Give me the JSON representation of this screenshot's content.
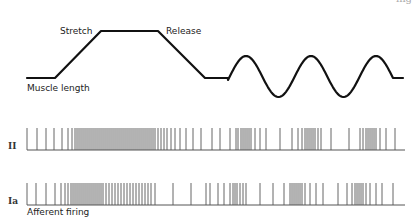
{
  "header": {
    "partial_text": "ing"
  },
  "muscle_trace": {
    "label_stretch": "Stretch",
    "label_release": "Release",
    "label_length": "Muscle length",
    "color": "#111111"
  },
  "rows": [
    {
      "label": "II",
      "name": "type-II"
    },
    {
      "label": "Ia",
      "name": "type-Ia"
    }
  ],
  "footer": {
    "label": "Afferent firing"
  },
  "chart_data": {
    "type": "diagram",
    "muscle_length": {
      "phases": [
        "baseline",
        "stretch (ramp up)",
        "hold",
        "release (ramp down)",
        "baseline",
        "sinusoidal stretch x3",
        "baseline"
      ],
      "points": [
        [
          27,
          78
        ],
        [
          55,
          78
        ],
        [
          101,
          31
        ],
        [
          158,
          31
        ],
        [
          205,
          78
        ],
        [
          228,
          78
        ]
      ],
      "sine": {
        "x_start": 228,
        "x_end": 393,
        "peaks_x": [
          246,
          311,
          376
        ],
        "troughs_x": [
          278,
          343
        ],
        "peak_y": 56,
        "trough_y": 97,
        "end_flat_to": 403
      }
    },
    "spike_trains": {
      "II": {
        "baseline_y": 150,
        "spike_top_y": 128,
        "x_range": [
          27,
          405
        ],
        "spikes_x": [
          27,
          37,
          46,
          54,
          62,
          68,
          72,
          75,
          77,
          79,
          81,
          83,
          85,
          87,
          89,
          91,
          93,
          95,
          97,
          99,
          101,
          103,
          105,
          107,
          109,
          111,
          113,
          115,
          117,
          119,
          121,
          123,
          125,
          127,
          129,
          131,
          133,
          135,
          137,
          139,
          141,
          143,
          145,
          147,
          149,
          151,
          153,
          155,
          158,
          161,
          164,
          167,
          171,
          175,
          180,
          186,
          193,
          201,
          212,
          220,
          230,
          236,
          238,
          241,
          243,
          245,
          247,
          249,
          251,
          255,
          260,
          266,
          280,
          292,
          298,
          302,
          305,
          307,
          309,
          311,
          313,
          315,
          318,
          321,
          331,
          349,
          360,
          363,
          366,
          368,
          370,
          372,
          374,
          376,
          380,
          386,
          395
        ]
      },
      "Ia": {
        "baseline_y": 205,
        "spike_top_y": 183,
        "x_range": [
          27,
          405
        ],
        "spikes_x": [
          27,
          36,
          46,
          55,
          61,
          65,
          68,
          71,
          73,
          75,
          77,
          79,
          81,
          83,
          85,
          87,
          89,
          91,
          93,
          95,
          97,
          99,
          101,
          103,
          106,
          109,
          112,
          115,
          118,
          121,
          124,
          127,
          130,
          133,
          136,
          139,
          142,
          145,
          148,
          151,
          155,
          173,
          191,
          206,
          210,
          218,
          224,
          230,
          233,
          235,
          237,
          240,
          243,
          246,
          260,
          273,
          284,
          290,
          292,
          294,
          296,
          298,
          300,
          302,
          305,
          310,
          316,
          323,
          338,
          347,
          352,
          355,
          357,
          359,
          361,
          363,
          366,
          370,
          376,
          382,
          393
        ]
      }
    }
  }
}
